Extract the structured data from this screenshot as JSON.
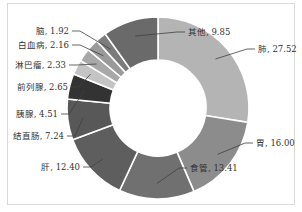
{
  "chart_data": {
    "type": "pie",
    "variant": "donut",
    "title": "",
    "categories": [
      "肺",
      "胃",
      "食管",
      "肝",
      "结直肠",
      "胰腺",
      "前列腺",
      "淋巴瘤",
      "白血病",
      "脑",
      "其他"
    ],
    "values": [
      27.52,
      16.0,
      13.41,
      12.4,
      7.24,
      4.51,
      2.65,
      2.33,
      2.16,
      1.92,
      9.85
    ],
    "labels": [
      "肺, 27.52",
      "胃, 16.00",
      "食管, 13.41",
      "肝, 12.40",
      "结直肠, 7.24",
      "胰腺, 4.51",
      "前列腺, 2.65",
      "淋巴瘤, 2.33",
      "白血病, 2.16",
      "脑, 1.92",
      "其他, 9.85"
    ],
    "colors": [
      "#b4b4b4",
      "#8c8c8c",
      "#707070",
      "#5e5e5e",
      "#585858",
      "#333333",
      "#c4c4c4",
      "#a8a8a8",
      "#9a9a9a",
      "#7c7c7c",
      "#6a6a6a"
    ],
    "start_angle_deg": 0,
    "direction": "clockwise",
    "legend": "none",
    "data_labels": "category, value with leader lines"
  }
}
